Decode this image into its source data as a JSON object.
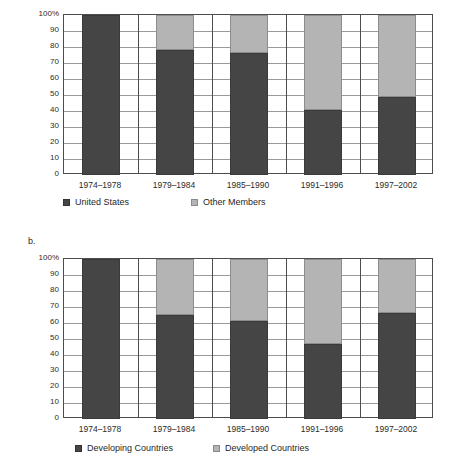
{
  "figure": {
    "caption_fragment": ""
  },
  "panels": [
    {
      "letter": "",
      "axis": {
        "yticks": [
          "100%",
          "90",
          "80",
          "70",
          "60",
          "50",
          "40",
          "30",
          "20",
          "10",
          "0"
        ],
        "ymin": 0,
        "ymax": 100
      },
      "legend": [
        {
          "label": "United States",
          "swatch": "dark-square-icon",
          "color": "#454545"
        },
        {
          "label": "Other Members",
          "swatch": "light-square-icon",
          "color": "#b4b4b4"
        }
      ],
      "categories": [
        "1974–1978",
        "1979–1984",
        "1985–1990",
        "1991–1996",
        "1997–2002"
      ]
    },
    {
      "letter": "b.",
      "axis": {
        "yticks": [
          "100%",
          "90",
          "80",
          "70",
          "60",
          "50",
          "40",
          "30",
          "20",
          "10",
          "0"
        ],
        "ymin": 0,
        "ymax": 100
      },
      "legend": [
        {
          "label": "Developing Countries",
          "swatch": "dark-square-icon",
          "color": "#454545"
        },
        {
          "label": "Developed Countries",
          "swatch": "light-square-icon",
          "color": "#b4b4b4"
        }
      ],
      "categories": [
        "1974–1978",
        "1979–1984",
        "1985–1990",
        "1991–1996",
        "1997–2002"
      ]
    }
  ],
  "chart_data": [
    {
      "type": "bar",
      "stacked": true,
      "normalized": true,
      "title": "",
      "panel": "a",
      "xlabel": "",
      "ylabel": "",
      "ylim": [
        0,
        100
      ],
      "yticks": [
        0,
        10,
        20,
        30,
        40,
        50,
        60,
        70,
        80,
        90,
        100
      ],
      "ytick_labels": [
        "0",
        "10",
        "20",
        "30",
        "40",
        "50",
        "60",
        "70",
        "80",
        "90",
        "100%"
      ],
      "grid": true,
      "legend_position": "below",
      "categories": [
        "1974–1978",
        "1979–1984",
        "1985–1990",
        "1991–1996",
        "1997–2002"
      ],
      "series": [
        {
          "name": "United States",
          "color": "#454545",
          "values": [
            100,
            78,
            76,
            40.5,
            48.5
          ]
        },
        {
          "name": "Other Members",
          "color": "#b4b4b4",
          "values": [
            0,
            22,
            24,
            59.5,
            51.5
          ]
        }
      ]
    },
    {
      "type": "bar",
      "stacked": true,
      "normalized": true,
      "title": "",
      "panel": "b",
      "xlabel": "",
      "ylabel": "",
      "ylim": [
        0,
        100
      ],
      "yticks": [
        0,
        10,
        20,
        30,
        40,
        50,
        60,
        70,
        80,
        90,
        100
      ],
      "ytick_labels": [
        "0",
        "10",
        "20",
        "30",
        "40",
        "50",
        "60",
        "70",
        "80",
        "90",
        "100%"
      ],
      "grid": true,
      "legend_position": "below",
      "categories": [
        "1974–1978",
        "1979–1984",
        "1985–1990",
        "1991–1996",
        "1997–2002"
      ],
      "series": [
        {
          "name": "Developing Countries",
          "color": "#454545",
          "values": [
            100,
            65,
            61.5,
            47,
            66
          ]
        },
        {
          "name": "Developed Countries",
          "color": "#b4b4b4",
          "values": [
            0,
            35,
            38.5,
            53,
            34
          ]
        }
      ]
    }
  ]
}
